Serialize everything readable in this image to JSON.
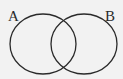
{
  "diagram": {
    "type": "venn",
    "background": "#f2f2f2",
    "stroke_color": "#2a2a2a",
    "sets": [
      {
        "label": "A",
        "cx": 43,
        "cy": 44,
        "rx": 33,
        "ry": 30
      },
      {
        "label": "B",
        "cx": 84,
        "cy": 44,
        "rx": 33,
        "ry": 30
      }
    ]
  }
}
